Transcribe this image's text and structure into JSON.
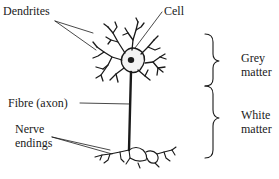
{
  "diagram": {
    "labels": {
      "dendrites": "Dendrites",
      "cell": "Cell",
      "fibre": "Fibre (axon)",
      "nerve_endings_1": "Nerve",
      "nerve_endings_2": "endings",
      "grey_1": "Grey",
      "grey_2": "matter",
      "white_1": "White",
      "white_2": "matter"
    },
    "colors": {
      "ink": "#1a1a1a",
      "background": "#ffffff"
    }
  }
}
